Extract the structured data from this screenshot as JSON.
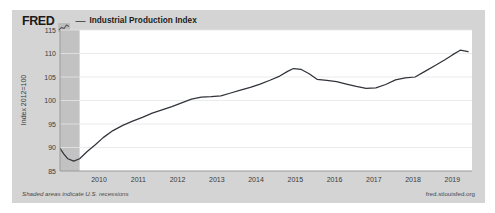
{
  "header": {
    "wordmark": "FRED",
    "logo_icon": "fred-chart-logo",
    "dash": "—",
    "series_title": "Industrial Production Index"
  },
  "footer": {
    "recession_note": "Shaded areas indicate U.S. recessions",
    "source_url": "fred.stlouisfed.org"
  },
  "colors": {
    "card_background": "#d4d4d4",
    "plot_background": "#ffffff",
    "line": "#31343b",
    "grid": "#e2e2e2",
    "axis": "#9a9a9a",
    "recession_shade": "#c2c2c2",
    "text": "#3b3b3b"
  },
  "chart_data": {
    "type": "line",
    "title": "Industrial Production Index",
    "xlabel": "",
    "ylabel": "Index 2012=100",
    "xlim": [
      2009.0,
      2019.5
    ],
    "ylim": [
      85,
      115
    ],
    "yticks": [
      85,
      90,
      95,
      100,
      105,
      110,
      115
    ],
    "xticks": [
      2010,
      2011,
      2012,
      2013,
      2014,
      2015,
      2016,
      2017,
      2018,
      2019
    ],
    "grid": true,
    "legend": null,
    "shaded_regions": [
      {
        "label": "U.S. recession",
        "x_start": 2009.0,
        "x_end": 2009.5
      }
    ],
    "series": [
      {
        "name": "Industrial Production Index",
        "color": "#31343b",
        "x": [
          2009.0,
          2009.1,
          2009.2,
          2009.35,
          2009.5,
          2009.7,
          2009.9,
          2010.1,
          2010.35,
          2010.6,
          2010.85,
          2011.1,
          2011.35,
          2011.6,
          2011.85,
          2012.1,
          2012.35,
          2012.6,
          2012.85,
          2013.1,
          2013.35,
          2013.6,
          2013.85,
          2014.1,
          2014.35,
          2014.6,
          2014.8,
          2014.95,
          2015.15,
          2015.35,
          2015.55,
          2015.8,
          2016.05,
          2016.3,
          2016.55,
          2016.8,
          2017.05,
          2017.3,
          2017.55,
          2017.8,
          2018.05,
          2018.3,
          2018.55,
          2018.8,
          2019.0,
          2019.2,
          2019.4
        ],
        "y": [
          89.8,
          88.6,
          87.6,
          87.1,
          87.6,
          89.2,
          90.6,
          92.1,
          93.6,
          94.7,
          95.6,
          96.4,
          97.3,
          98.0,
          98.7,
          99.5,
          100.3,
          100.7,
          100.8,
          101.0,
          101.6,
          102.2,
          102.8,
          103.5,
          104.3,
          105.2,
          106.2,
          106.8,
          106.6,
          105.7,
          104.5,
          104.3,
          104.0,
          103.5,
          103.0,
          102.6,
          102.7,
          103.4,
          104.4,
          104.8,
          105.0,
          106.2,
          107.4,
          108.6,
          109.7,
          110.7,
          110.4
        ]
      }
    ]
  }
}
